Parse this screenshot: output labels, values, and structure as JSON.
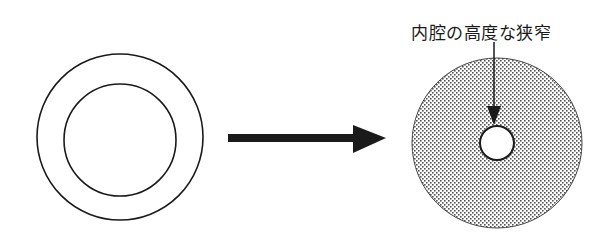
{
  "diagram": {
    "type": "before-after cross-section",
    "before": {
      "description": "normal vessel cross-section",
      "outer_ring": {
        "cx": 120,
        "cy": 137,
        "r": 83
      },
      "inner_ring": {
        "cx": 120,
        "cy": 140,
        "r": 56
      }
    },
    "transition_arrow": {
      "x1": 228,
      "x2": 386,
      "y": 138,
      "color": "#1a1a1a"
    },
    "after": {
      "description": "thickened wall with severely narrowed lumen",
      "outer_disc": {
        "cx": 497,
        "cy": 143,
        "r": 85,
        "fill": "stippled"
      },
      "lumen": {
        "cx": 497,
        "cy": 143,
        "r": 17
      },
      "annotation": {
        "label": "内腔の高度な狭窄",
        "pointer": {
          "x": 494,
          "y1": 42,
          "y2": 125
        }
      }
    },
    "colors": {
      "line": "#1a1a1a",
      "dot": "#555555",
      "background": "#ffffff"
    }
  }
}
